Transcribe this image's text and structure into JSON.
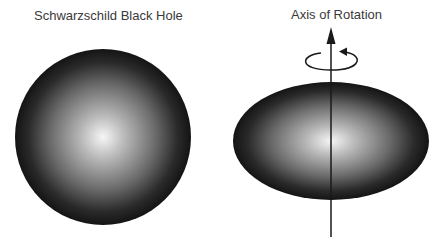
{
  "diagram": {
    "left_panel": {
      "title": "Schwarzschild Black Hole",
      "shape": "sphere",
      "shading": {
        "center_color": "#f4f4f4",
        "edge_color": "#141414"
      }
    },
    "right_panel": {
      "title": "Axis of Rotation",
      "shape": "oblate-ellipsoid",
      "shading": {
        "center_color": "#f4f4f4",
        "edge_color": "#141414"
      },
      "axis": {
        "arrow_direction": "up",
        "rotation_indicator": "counter-clockwise loop"
      }
    }
  }
}
